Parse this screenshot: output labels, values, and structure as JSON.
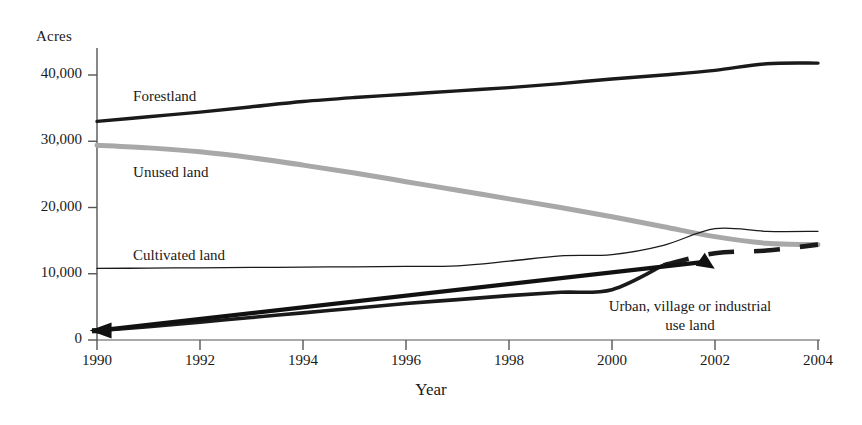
{
  "chart_data": {
    "type": "line",
    "title": "",
    "xlabel": "Year",
    "ylabel": "Acres",
    "x": [
      1990,
      1991,
      1992,
      1993,
      1994,
      1995,
      1996,
      1997,
      1998,
      1999,
      2000,
      2001,
      2002,
      2003,
      2004
    ],
    "xticks": [
      "1990",
      "1992",
      "1994",
      "1996",
      "1998",
      "2000",
      "2002",
      "2004"
    ],
    "xtick_values": [
      1990,
      1992,
      1994,
      1996,
      1998,
      2000,
      2002,
      2004
    ],
    "yticks": [
      "0",
      "10,000",
      "20,000",
      "30,000",
      "40,000"
    ],
    "ytick_values": [
      0,
      10000,
      20000,
      30000,
      40000
    ],
    "xlim": [
      1990,
      2004
    ],
    "ylim": [
      0,
      44000
    ],
    "grid": false,
    "legend_position": "inline-labels",
    "series": [
      {
        "name": "Forestland",
        "color": "#1a1a1a",
        "width": 3.4,
        "style": "solid",
        "label_x": 1990.7,
        "label_y": 36600,
        "values": [
          33000,
          33700,
          34400,
          35200,
          36000,
          36600,
          37100,
          37600,
          38100,
          38700,
          39400,
          40000,
          40700,
          41700,
          41800
        ]
      },
      {
        "name": "Unused land",
        "color": "#a8a8a8",
        "width": 5.0,
        "style": "solid",
        "label_x": 1990.7,
        "label_y": 25100,
        "values": [
          29400,
          29000,
          28400,
          27500,
          26400,
          25200,
          23900,
          22600,
          21300,
          20000,
          18600,
          17100,
          15600,
          14600,
          14400
        ]
      },
      {
        "name": "Cultivated land",
        "color": "#1a1a1a",
        "width": 1.3,
        "style": "solid",
        "label_x": 1990.7,
        "label_y": 12500,
        "values": [
          10800,
          10850,
          10900,
          10950,
          11000,
          11050,
          11100,
          11200,
          11900,
          12700,
          12900,
          14300,
          16800,
          16400,
          16400
        ]
      },
      {
        "name": "Urban, village or industrial use land",
        "color": "#1a1a1a",
        "width": 3.6,
        "style": "solid-then-dashed",
        "values": [
          1400,
          2000,
          2700,
          3400,
          4100,
          4800,
          5500,
          6100,
          6700,
          7200,
          7600,
          11300,
          13100,
          13500,
          14400
        ]
      }
    ],
    "annotations": [
      {
        "name": "urban-annotation",
        "text_line1": "Urban, village or industrial",
        "text_line2": "use land",
        "arrow_from_x": 2001.8,
        "arrow_from_y": 11800,
        "arrow_to_x": 1990.05,
        "arrow_to_y": 1450
      }
    ]
  },
  "axis": {
    "y_unit_label": "Acres",
    "x_title": "Year"
  }
}
